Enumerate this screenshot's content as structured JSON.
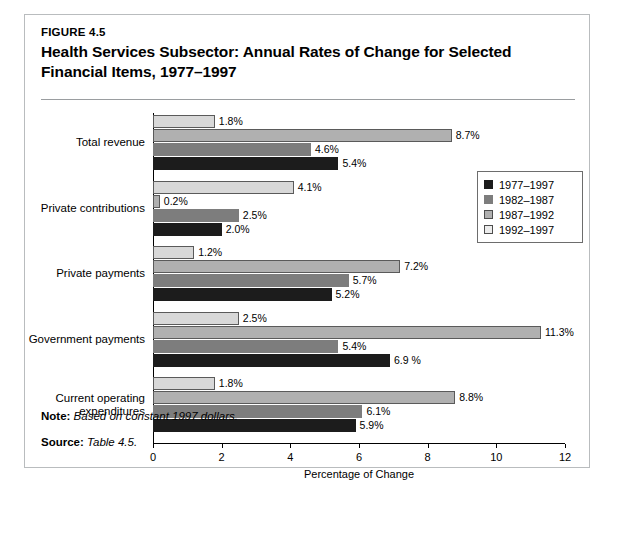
{
  "figure": {
    "number": "FIGURE 4.5",
    "title_line1": "Health Services Subsector: Annual Rates of Change for Selected",
    "title_line2": "Financial Items, 1977–1997"
  },
  "footer": {
    "note_key": "Note:",
    "note_value": "Based on constant 1997 dollars.",
    "source_key": "Source:",
    "source_value": "Table 4.5."
  },
  "colors": {
    "series_1977_1997": "#1c1c1c",
    "series_1982_1987": "#7d7d7d",
    "series_1987_1992": "#b0b0b0",
    "series_1992_1997": "#d8d8d8",
    "border": "#b9bcbe",
    "rule": "#9a9da0"
  },
  "chart_data": {
    "type": "bar",
    "orientation": "horizontal",
    "grouped": true,
    "title": "Health Services Subsector: Annual Rates of Change for Selected Financial Items, 1977–1997",
    "xlabel": "Percentage of Change",
    "ylabel": "",
    "xlim": [
      0,
      12
    ],
    "xticks": [
      "0",
      "2",
      "4",
      "6",
      "8",
      "10",
      "12"
    ],
    "xtick_values": [
      0,
      2,
      4,
      6,
      8,
      10,
      12
    ],
    "grid": false,
    "legend_position": "upper right inside",
    "categories": [
      "Total revenue",
      "Private contributions",
      "Private payments",
      "Government payments",
      "Current operating expenditures"
    ],
    "category_lines": [
      [
        "Total revenue"
      ],
      [
        "Private contributions"
      ],
      [
        "Private payments"
      ],
      [
        "Government payments"
      ],
      [
        "Current operating",
        "expenditures"
      ]
    ],
    "series": [
      {
        "name": "1977–1997",
        "color": "#1c1c1c",
        "values": [
          5.4,
          2.0,
          5.2,
          6.9,
          5.9
        ],
        "labels": [
          "5.4%",
          "2.0%",
          "5.2%",
          "6.9 %",
          "5.9%"
        ]
      },
      {
        "name": "1982–1987",
        "color": "#7d7d7d",
        "values": [
          4.6,
          2.5,
          5.7,
          5.4,
          6.1
        ],
        "labels": [
          "4.6%",
          "2.5%",
          "5.7%",
          "5.4%",
          "6.1%"
        ]
      },
      {
        "name": "1987–1992",
        "color": "#b0b0b0",
        "values": [
          8.7,
          0.2,
          7.2,
          11.3,
          8.8
        ],
        "labels": [
          "8.7%",
          "0.2%",
          "7.2%",
          "11.3%",
          "8.8%"
        ]
      },
      {
        "name": "1992–1997",
        "color": "#d8d8d8",
        "values": [
          1.8,
          4.1,
          1.2,
          2.5,
          1.8
        ],
        "labels": [
          "1.8%",
          "4.1%",
          "1.2%",
          "2.5%",
          "1.8%"
        ]
      }
    ]
  },
  "legend": {
    "items": [
      {
        "label": "1977–1997"
      },
      {
        "label": "1982–1987"
      },
      {
        "label": "1987–1992"
      },
      {
        "label": "1992–1997"
      }
    ]
  }
}
